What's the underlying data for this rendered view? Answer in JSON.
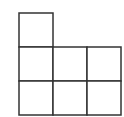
{
  "diagram": {
    "stroke_color": "#333333",
    "background": "#ffffff",
    "cell_size": 34,
    "origin": {
      "x": 19,
      "y": 13
    },
    "cells": [
      {
        "row": 0,
        "col": 0
      },
      {
        "row": 1,
        "col": 0
      },
      {
        "row": 1,
        "col": 1
      },
      {
        "row": 1,
        "col": 2
      },
      {
        "row": 2,
        "col": 0
      },
      {
        "row": 2,
        "col": 1
      },
      {
        "row": 2,
        "col": 2
      }
    ]
  }
}
